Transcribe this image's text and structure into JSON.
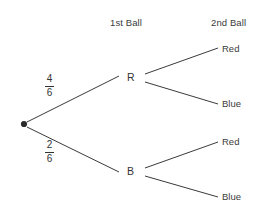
{
  "diagram": {
    "type": "probability-tree",
    "headers": {
      "first_ball": "1st Ball",
      "second_ball": "2nd Ball"
    },
    "root": {
      "name": "start-node",
      "marker": "filled-dot"
    },
    "level1": [
      {
        "label": "R",
        "probability": {
          "numerator": "4",
          "denominator": "6"
        }
      },
      {
        "label": "B",
        "probability": {
          "numerator": "2",
          "denominator": "6"
        }
      }
    ],
    "level2": [
      {
        "label": "Red",
        "parent": "R"
      },
      {
        "label": "Blue",
        "parent": "R"
      },
      {
        "label": "Red",
        "parent": "B"
      },
      {
        "label": "Blue",
        "parent": "B"
      }
    ],
    "colors": {
      "line": "#3a3a3a",
      "text": "#333333",
      "background": "#ffffff"
    }
  }
}
